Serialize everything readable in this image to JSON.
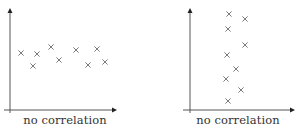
{
  "chart_data": [
    {
      "type": "scatter",
      "title": "",
      "caption": "no correlation",
      "xlabel": "",
      "ylabel": "",
      "grid": false,
      "marker": "x",
      "axes": {
        "origin": [
          10,
          110
        ],
        "x_end": 117,
        "y_top": 8,
        "x_start": 4
      },
      "points": [
        [
          21,
          53
        ],
        [
          33,
          66
        ],
        [
          37,
          54
        ],
        [
          51,
          47
        ],
        [
          59,
          60
        ],
        [
          76,
          50
        ],
        [
          88,
          65
        ],
        [
          97,
          49
        ],
        [
          105,
          62
        ]
      ],
      "caption_x": 65
    },
    {
      "type": "scatter",
      "title": "",
      "caption": "no correlation",
      "xlabel": "",
      "ylabel": "",
      "grid": false,
      "marker": "x",
      "axes": {
        "origin": [
          190,
          110
        ],
        "x_end": 295,
        "y_top": 8,
        "x_start": 183
      },
      "points": [
        [
          229,
          14
        ],
        [
          245,
          19
        ],
        [
          228,
          29
        ],
        [
          245,
          45
        ],
        [
          227,
          55
        ],
        [
          236,
          69
        ],
        [
          226,
          79
        ],
        [
          241,
          90
        ],
        [
          228,
          101
        ]
      ],
      "caption_x": 238
    }
  ],
  "colors": {
    "axis": "#555555",
    "marker": "#7a7a7a",
    "text": "#333333"
  }
}
